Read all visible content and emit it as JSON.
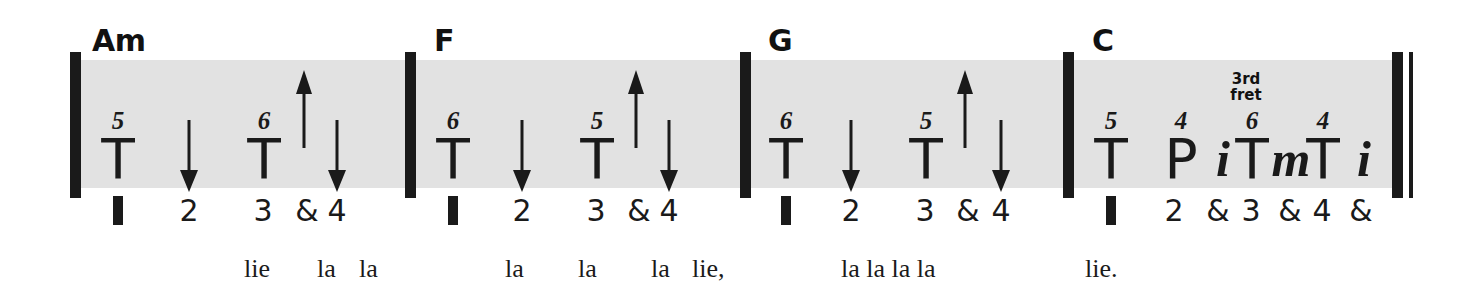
{
  "sheet": {
    "type": "guitar-strum-chart",
    "band_color": "#e2e2e2",
    "ink_color": "#1a1a1a",
    "measures": [
      {
        "chord": "Am",
        "strums": [
          {
            "symbol": "T",
            "fret": "5"
          },
          {
            "symbol": "T",
            "fret": "6"
          }
        ],
        "arrows": [
          "down",
          "up",
          "down"
        ],
        "beats": [
          "1",
          "2",
          "3",
          "&",
          "4"
        ],
        "lyrics": [
          "lie",
          "la",
          "la"
        ]
      },
      {
        "chord": "F",
        "strums": [
          {
            "symbol": "T",
            "fret": "6"
          },
          {
            "symbol": "T",
            "fret": "5"
          }
        ],
        "arrows": [
          "down",
          "up",
          "down"
        ],
        "beats": [
          "1",
          "2",
          "3",
          "&",
          "4"
        ],
        "lyrics": [
          "la",
          "la",
          "la",
          "lie,"
        ]
      },
      {
        "chord": "G",
        "strums": [
          {
            "symbol": "T",
            "fret": "6"
          },
          {
            "symbol": "T",
            "fret": "5"
          }
        ],
        "arrows": [
          "down",
          "up",
          "down"
        ],
        "beats": [
          "1",
          "2",
          "3",
          "&",
          "4"
        ],
        "lyrics": [
          "la la la la"
        ]
      },
      {
        "chord": "C",
        "fret_label_line1": "3rd",
        "fret_label_line2": "fret",
        "strums": [
          {
            "symbol": "T",
            "fret": "5"
          },
          {
            "symbol": "P",
            "fret": "4"
          },
          {
            "symbol": "i",
            "fret": ""
          },
          {
            "symbol": "T",
            "fret": "6"
          },
          {
            "symbol": "m",
            "fret": ""
          },
          {
            "symbol": "T",
            "fret": "4"
          },
          {
            "symbol": "i",
            "fret": ""
          }
        ],
        "arrows": [],
        "beats": [
          "1",
          "2",
          "&",
          "3",
          "&",
          "4",
          "&"
        ],
        "lyrics": [
          "lie."
        ]
      }
    ]
  }
}
